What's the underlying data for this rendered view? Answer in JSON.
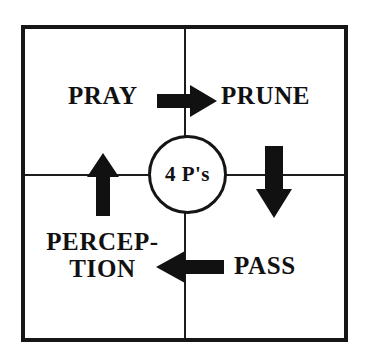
{
  "diagram": {
    "center": {
      "label": "4 P's",
      "shape": "circle"
    },
    "colors": {
      "ink": "#111111",
      "frame": "#161616",
      "divider": "#1d1d1d",
      "background": "#ffffff",
      "arrow_fill": "#111111"
    },
    "quadrants": [
      {
        "position": "top-left",
        "label": "PRAY"
      },
      {
        "position": "top-right",
        "label": "PRUNE"
      },
      {
        "position": "bottom-right",
        "label": "PASS"
      },
      {
        "position": "bottom-left",
        "label_line_1": "PERCEP-",
        "label_line_2": "TION",
        "label_full": "PERCEPTION"
      }
    ],
    "arrows": [
      {
        "name": "arrow-right",
        "direction": "right",
        "from": "PRAY",
        "to": "PRUNE"
      },
      {
        "name": "arrow-down",
        "direction": "down",
        "from": "PRUNE",
        "to": "PASS"
      },
      {
        "name": "arrow-left",
        "direction": "left",
        "from": "PASS",
        "to": "PERCEPTION"
      },
      {
        "name": "arrow-up",
        "direction": "up",
        "from": "PERCEPTION",
        "to": "PRAY"
      }
    ]
  }
}
